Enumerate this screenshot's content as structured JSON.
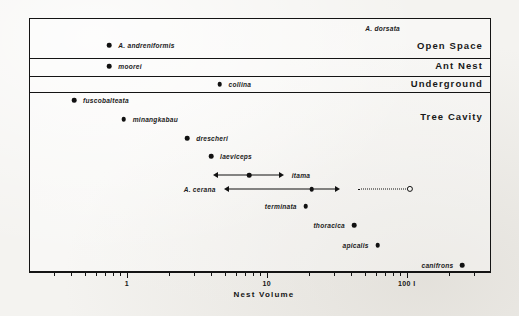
{
  "figure": {
    "axis_title": "Nest Volume",
    "axis_unit_suffix": "l"
  },
  "chart_data": {
    "type": "scatter",
    "title": "Nest Volume",
    "xlabel": "Nest Volume",
    "ylabel": "",
    "xscale": "log",
    "xlim": [
      0.2,
      400
    ],
    "xunit": "litres",
    "grid": false,
    "legend": "none",
    "tick_labels": [
      "1",
      "10",
      "100 l"
    ],
    "tick_values": [
      1,
      10,
      100
    ],
    "minor_ticks": [
      0.3,
      0.4,
      0.5,
      0.6,
      0.7,
      0.8,
      0.9,
      2,
      3,
      4,
      5,
      6,
      7,
      8,
      9,
      20,
      30,
      40,
      50,
      60,
      70,
      80,
      90,
      200,
      300
    ],
    "bands": [
      {
        "name": "Open Space",
        "label": "Open Space"
      },
      {
        "name": "Ant Nest",
        "label": "Ant Nest"
      },
      {
        "name": "Underground",
        "label": "Underground"
      },
      {
        "name": "Tree Cavity",
        "label": "Tree Cavity"
      }
    ],
    "points": [
      {
        "label": "A. dorsata",
        "band": "Open Space",
        "value": null,
        "marker": "none",
        "label_side": "left"
      },
      {
        "label": "A. andreniformis",
        "band": "Open Space",
        "value": 0.75,
        "marker": "solid",
        "label_side": "right"
      },
      {
        "label": "moorei",
        "band": "Ant Nest",
        "value": 0.75,
        "marker": "solid",
        "label_side": "right"
      },
      {
        "label": "collina",
        "band": "Underground",
        "value": 4.6,
        "marker": "solid",
        "label_side": "right"
      },
      {
        "label": "fuscobalteata",
        "band": "Tree Cavity",
        "value": 0.42,
        "marker": "solid",
        "label_side": "right"
      },
      {
        "label": "minangkabau",
        "band": "Tree Cavity",
        "value": 0.95,
        "marker": "solid",
        "label_side": "right"
      },
      {
        "label": "drescheri",
        "band": "Tree Cavity",
        "value": 2.7,
        "marker": "solid",
        "label_side": "right"
      },
      {
        "label": "laeviceps",
        "band": "Tree Cavity",
        "value": 4.0,
        "marker": "solid",
        "label_side": "right"
      },
      {
        "label": "itama",
        "band": "Tree Cavity",
        "value": 7.5,
        "marker": "solid",
        "label_side": "right",
        "range": {
          "low": 4.2,
          "high": 13,
          "low_arrow": true,
          "high_arrow": true
        }
      },
      {
        "label": "A. cerana",
        "band": "Tree Cavity",
        "value": 21,
        "marker": "solid",
        "label_side": "left",
        "range": {
          "low": 5.0,
          "high": 33,
          "low_arrow": true,
          "high_arrow": true
        },
        "extension": {
          "from": 45,
          "to": 105,
          "style": "dotted",
          "end_marker": "open"
        }
      },
      {
        "label": "terminata",
        "band": "Tree Cavity",
        "value": 19,
        "marker": "solid",
        "label_side": "left"
      },
      {
        "label": "thoracica",
        "band": "Tree Cavity",
        "value": 42,
        "marker": "solid",
        "label_side": "left"
      },
      {
        "label": "apicalis",
        "band": "Tree Cavity",
        "value": 62,
        "marker": "solid",
        "label_side": "left"
      },
      {
        "label": "canifrons",
        "band": "Tree Cavity",
        "value": 250,
        "marker": "solid",
        "label_side": "left"
      }
    ]
  }
}
